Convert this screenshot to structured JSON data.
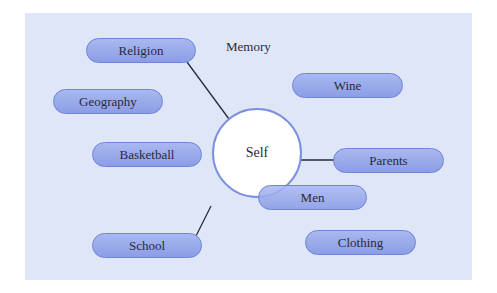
{
  "diagram": {
    "type": "concept-map",
    "center": {
      "label": "Self"
    },
    "free_label": {
      "label": "Memory"
    },
    "nodes": [
      {
        "id": "religion",
        "label": "Religion",
        "connected": true
      },
      {
        "id": "geography",
        "label": "Geography",
        "connected": false
      },
      {
        "id": "basketball",
        "label": "Basketball",
        "connected": false
      },
      {
        "id": "school",
        "label": "School",
        "connected": true
      },
      {
        "id": "wine",
        "label": "Wine",
        "connected": false
      },
      {
        "id": "parents",
        "label": "Parents",
        "connected": true
      },
      {
        "id": "men",
        "label": "Men",
        "connected": false
      },
      {
        "id": "clothing",
        "label": "Clothing",
        "connected": false
      }
    ],
    "colors": {
      "background": "#dfe6f8",
      "pill_fill": "#99abea",
      "pill_border": "#6f84d8",
      "center_fill": "#ffffff",
      "center_border": "#7b90df",
      "connector": "#2a2a3a"
    }
  }
}
